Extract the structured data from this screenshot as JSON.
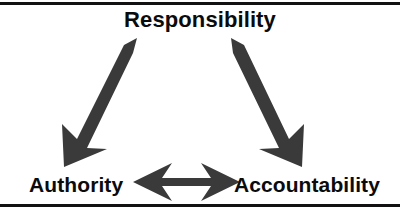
{
  "figure": {
    "type": "triangle-relationship-diagram",
    "background_color": "#ffffff",
    "rule_color": "#111111",
    "arrow_color": "#3a3a3a",
    "text_color": "#0b0b0b",
    "nodes": [
      {
        "id": "responsibility",
        "label": "Responsibility",
        "position": "top-center"
      },
      {
        "id": "authority",
        "label": "Authority",
        "position": "bottom-left"
      },
      {
        "id": "accountability",
        "label": "Accountability",
        "position": "bottom-right"
      }
    ],
    "connectors": [
      {
        "id": "authority-responsibility",
        "from": "Authority",
        "to": "Responsibility",
        "style": "double-headed-arrow",
        "orientation": "diagonal-up-right"
      },
      {
        "id": "responsibility-accountability",
        "from": "Responsibility",
        "to": "Accountability",
        "style": "double-headed-arrow",
        "orientation": "diagonal-down-right"
      },
      {
        "id": "authority-accountability",
        "from": "Authority",
        "to": "Accountability",
        "style": "double-headed-arrow",
        "orientation": "horizontal"
      }
    ],
    "rules": [
      {
        "id": "top-rule",
        "position": "top"
      },
      {
        "id": "bottom-rule",
        "position": "bottom"
      }
    ]
  }
}
